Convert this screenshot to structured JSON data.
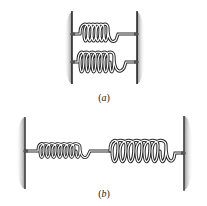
{
  "figure": {
    "panels": [
      {
        "id": "a",
        "caption": "(a)",
        "arrangement": "parallel",
        "springs": [
          {
            "name": "upper spring",
            "coils": 6
          },
          {
            "name": "lower spring",
            "coils": 6
          }
        ],
        "supports": [
          "left wall",
          "right wall"
        ]
      },
      {
        "id": "b",
        "caption": "(b)",
        "arrangement": "series",
        "springs": [
          {
            "name": "left spring",
            "coils": 7
          },
          {
            "name": "right spring",
            "coils": 7
          }
        ],
        "supports": [
          "left wall",
          "right wall"
        ]
      }
    ],
    "colors": {
      "line": "#2a2a2a",
      "wall_shade": "#7a7a7a",
      "background": "#ffffff"
    }
  }
}
